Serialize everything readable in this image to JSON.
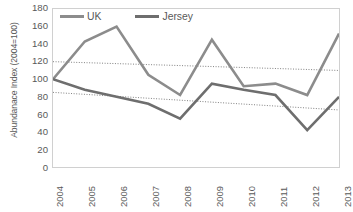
{
  "chart_data": {
    "type": "line",
    "title": "",
    "xlabel": "",
    "ylabel": "Abundanace Index (2004=100)",
    "categories": [
      "2004",
      "2005",
      "2006",
      "2007",
      "2008",
      "2009",
      "2010",
      "2011",
      "2012",
      "2013"
    ],
    "x": [
      2004,
      2005,
      2006,
      2007,
      2008,
      2009,
      2010,
      2011,
      2012,
      2013
    ],
    "ylim": [
      0,
      180
    ],
    "yticks": [
      0,
      20,
      40,
      60,
      80,
      100,
      120,
      140,
      160,
      180
    ],
    "xlim": [
      2004,
      2013
    ],
    "grid": false,
    "legend_position": "top-left-inside",
    "series": [
      {
        "name": "UK",
        "color": "#8c8c8c",
        "values": [
          100,
          143,
          160,
          105,
          82,
          145,
          92,
          95,
          82,
          152
        ]
      },
      {
        "name": "Jersey",
        "color": "#6e6e6e",
        "values": [
          100,
          88,
          80,
          72,
          55,
          95,
          88,
          82,
          42,
          80
        ]
      }
    ],
    "trendlines": [
      {
        "name": "UK trendline",
        "style": "dotted",
        "color": "#808080",
        "start": {
          "x": 2004,
          "y": 120
        },
        "end": {
          "x": 2013,
          "y": 110
        }
      },
      {
        "name": "Jersey trendline",
        "style": "dotted",
        "color": "#808080",
        "start": {
          "x": 2004,
          "y": 85
        },
        "end": {
          "x": 2013,
          "y": 65
        }
      }
    ]
  },
  "legend": {
    "entries": [
      {
        "label": "UK"
      },
      {
        "label": "Jersey"
      }
    ]
  }
}
